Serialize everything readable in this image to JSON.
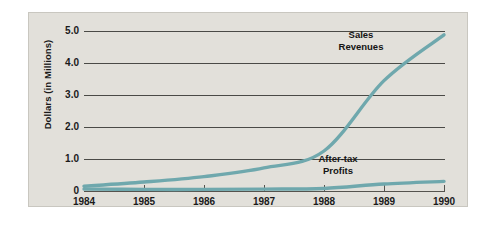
{
  "chart_data": {
    "type": "line",
    "title": "",
    "xlabel": "",
    "ylabel": "Dollars (in Millions)",
    "x": [
      1984,
      1985,
      1986,
      1987,
      1988,
      1989,
      1990
    ],
    "xtick_labels": [
      "1984",
      "1985",
      "1986",
      "1987",
      "1988",
      "1989",
      "1990"
    ],
    "ytick_labels": [
      "0",
      "1.0",
      "2.0",
      "3.0",
      "4.0",
      "5.0"
    ],
    "ytick_values": [
      0,
      1.0,
      2.0,
      3.0,
      4.0,
      5.0
    ],
    "xlim": [
      1984,
      1990
    ],
    "ylim": [
      0,
      5.2
    ],
    "grid": "horizontal",
    "legend_position": "inline-annotations",
    "series": [
      {
        "name": "Sales Revenues",
        "label_lines": [
          "Sales",
          "Revenues"
        ],
        "color": "#6fa8ad",
        "values": [
          0.15,
          0.28,
          0.45,
          0.72,
          1.25,
          3.45,
          4.88
        ]
      },
      {
        "name": "After-tax Profits",
        "label_lines": [
          "After-tax",
          "Profits"
        ],
        "color": "#6fa8ad",
        "values": [
          0.06,
          0.05,
          0.05,
          0.06,
          0.08,
          0.22,
          0.3
        ]
      }
    ],
    "colors": {
      "line": "#6fa8ad",
      "panel_background": "#e2e0da",
      "gridline": "#4a4a46",
      "axis": "#55534e",
      "text": "#1a1a1a",
      "page_background": "#ffffff"
    }
  },
  "axes": {
    "y_title": "Dollars (in Millions)",
    "y_ticks": [
      {
        "label": "5.0"
      },
      {
        "label": "4.0"
      },
      {
        "label": "3.0"
      },
      {
        "label": "2.0"
      },
      {
        "label": "1.0"
      },
      {
        "label": "0"
      }
    ],
    "x_ticks": [
      {
        "label": "1984"
      },
      {
        "label": "1985"
      },
      {
        "label": "1986"
      },
      {
        "label": "1987"
      },
      {
        "label": "1988"
      },
      {
        "label": "1989"
      },
      {
        "label": "1990"
      }
    ]
  },
  "annotations": {
    "sales": {
      "line1": "Sales",
      "line2": "Revenues"
    },
    "profits": {
      "line1": "After-tax",
      "line2": "Profits"
    }
  }
}
